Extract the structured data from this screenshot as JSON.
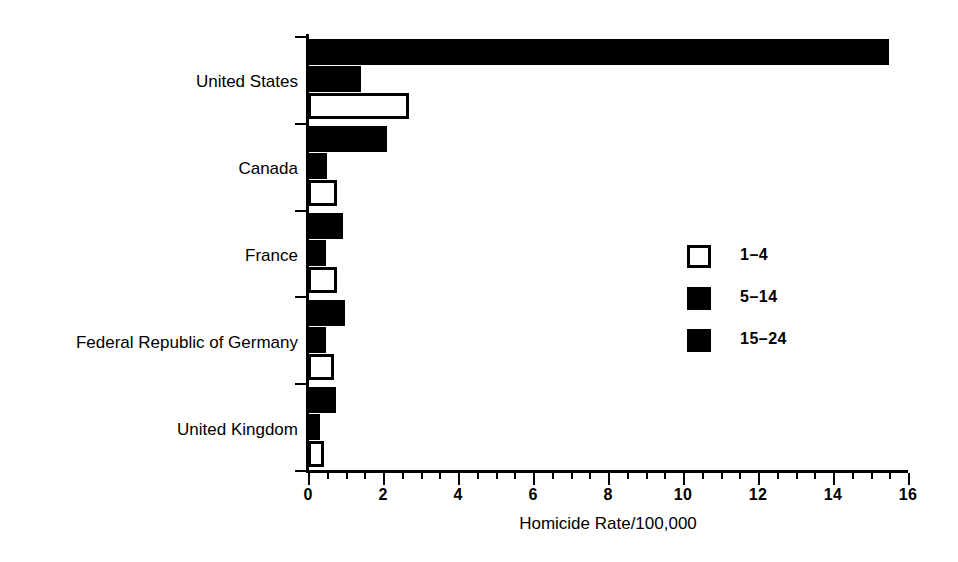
{
  "chart_data": {
    "type": "bar",
    "orientation": "horizontal",
    "title": "",
    "xlabel": "Homicide Rate/100,000",
    "ylabel": "",
    "xlim": [
      0,
      16
    ],
    "xticks": [
      0,
      2,
      4,
      6,
      8,
      10,
      12,
      14,
      16
    ],
    "xtick_labels": [
      "0",
      "2",
      "4",
      "6",
      "8",
      "10",
      "12",
      "14",
      "16"
    ],
    "minor_tick_step": 0.5,
    "grid": false,
    "legend_position": "center-right",
    "categories": [
      "United States",
      "Canada",
      "France",
      "Federal Republic of Germany",
      "United Kingdom"
    ],
    "series": [
      {
        "name": "15-24",
        "style": "filled",
        "values": [
          15.5,
          2.1,
          0.93,
          0.99,
          0.75
        ]
      },
      {
        "name": "5-14",
        "style": "filled",
        "values": [
          1.4,
          0.5,
          0.48,
          0.48,
          0.32
        ]
      },
      {
        "name": "1-4",
        "style": "open",
        "values": [
          2.7,
          0.78,
          0.77,
          0.7,
          0.43
        ]
      }
    ]
  },
  "legend": {
    "entries": [
      {
        "label": "1–4",
        "style": "open"
      },
      {
        "label": "5–14",
        "style": "filled"
      },
      {
        "label": "15–24",
        "style": "filled"
      }
    ]
  },
  "colors": {
    "ink": "#000000",
    "background": "#ffffff"
  }
}
